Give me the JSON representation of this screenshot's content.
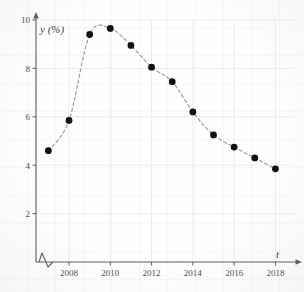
{
  "chart_data": {
    "type": "scatter",
    "title": "",
    "xlabel": "t",
    "ylabel": "y (%)",
    "x": [
      2007,
      2008,
      2009,
      2010,
      2011,
      2012,
      2013,
      2014,
      2015,
      2016,
      2017,
      2018
    ],
    "values": [
      4.6,
      5.85,
      9.4,
      9.65,
      8.95,
      8.05,
      7.45,
      6.2,
      5.25,
      4.75,
      4.3,
      3.85
    ],
    "xtick_labels": [
      "2008",
      "2010",
      "2012",
      "2014",
      "2016",
      "2018"
    ],
    "xticks": [
      2008,
      2010,
      2012,
      2014,
      2016,
      2018
    ],
    "ytick_labels": [
      "2",
      "4",
      "6",
      "8",
      "10"
    ],
    "yticks": [
      2,
      4,
      6,
      8,
      10
    ],
    "xlim": [
      2006.4,
      2018.9
    ],
    "ylim": [
      0,
      10
    ],
    "grid": true,
    "legend": "none",
    "axis_break": "x-axis zigzag near origin",
    "marker": "filled-circle",
    "line_style": "dashed",
    "colors": {
      "marker": "#111111",
      "line": "#9a9a9a",
      "axis": "#5a5a5a",
      "grid": "#ececf0",
      "text": "#4a4a4a",
      "background": "#fefefe"
    }
  },
  "axes": {
    "y_title": "y (%)",
    "x_title": "t"
  }
}
